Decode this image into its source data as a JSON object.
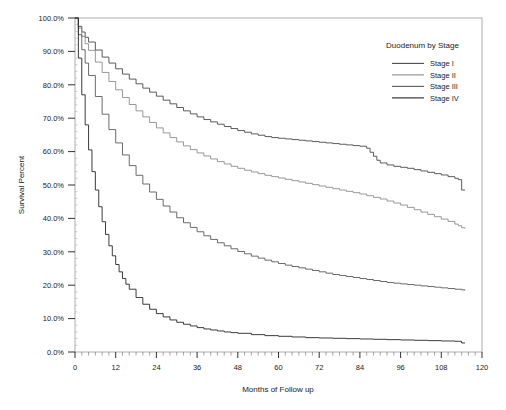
{
  "chart_data": {
    "type": "line",
    "title": "",
    "xlabel": "Months of Follow up",
    "ylabel": "Survival Percent",
    "xlim": [
      0,
      120
    ],
    "ylim": [
      0,
      100
    ],
    "xticks": [
      0,
      12,
      24,
      36,
      48,
      60,
      72,
      84,
      96,
      108,
      120
    ],
    "xtick_labels": [
      "0",
      "12",
      "24",
      "36",
      "48",
      "60",
      "72",
      "84",
      "96",
      "108",
      "120"
    ],
    "yticks": [
      0,
      10,
      20,
      30,
      40,
      50,
      60,
      70,
      80,
      90,
      100
    ],
    "ytick_labels": [
      "0.0%",
      "10.0%",
      "20.0%",
      "30.0%",
      "40.0%",
      "50.0%",
      "60.0%",
      "70.0%",
      "80.0%",
      "90.0%",
      "100.0%"
    ],
    "minor_tick_interval": 2,
    "grid": false,
    "legend": {
      "title": "Duodenum by Stage",
      "position": "top-right",
      "entries": [
        {
          "label": "Stage I",
          "color": "#4a4a4a"
        },
        {
          "label": "Stage II",
          "color": "#8c8c8c"
        },
        {
          "label": "Stage III",
          "color": "#5a5a5a"
        },
        {
          "label": "Stage IV",
          "color": "#262626"
        }
      ]
    },
    "series": [
      {
        "name": "Stage I",
        "color": "#4a4a4a",
        "x": [
          0,
          1,
          2,
          3,
          4,
          6,
          8,
          10,
          12,
          14,
          16,
          18,
          20,
          22,
          24,
          26,
          28,
          30,
          32,
          34,
          36,
          38,
          40,
          42,
          44,
          46,
          48,
          50,
          52,
          54,
          56,
          58,
          60,
          62,
          64,
          66,
          68,
          70,
          72,
          74,
          76,
          78,
          80,
          82,
          84,
          86,
          87,
          88,
          89,
          90,
          92,
          94,
          96,
          98,
          100,
          102,
          104,
          106,
          108,
          110,
          112,
          113,
          114,
          115
        ],
        "y": [
          100.0,
          97.5,
          95.8,
          94.2,
          92.8,
          90.4,
          88.3,
          86.5,
          84.8,
          83.2,
          81.7,
          80.3,
          79.0,
          77.8,
          76.6,
          75.4,
          74.3,
          73.2,
          72.2,
          71.3,
          70.4,
          69.6,
          68.9,
          68.2,
          67.5,
          66.9,
          66.3,
          65.8,
          65.3,
          64.9,
          64.5,
          64.2,
          64.0,
          63.8,
          63.6,
          63.4,
          63.2,
          63.0,
          62.8,
          62.6,
          62.4,
          62.2,
          62.0,
          61.8,
          61.6,
          61.0,
          59.8,
          58.6,
          57.4,
          56.6,
          56.0,
          55.6,
          55.3,
          55.0,
          54.6,
          54.2,
          53.8,
          53.4,
          53.0,
          52.5,
          52.0,
          51.6,
          48.5,
          48.5
        ]
      },
      {
        "name": "Stage II",
        "color": "#8c8c8c",
        "x": [
          0,
          1,
          2,
          3,
          4,
          6,
          8,
          10,
          12,
          14,
          16,
          18,
          20,
          22,
          24,
          26,
          28,
          30,
          32,
          34,
          36,
          38,
          40,
          42,
          44,
          46,
          48,
          50,
          52,
          54,
          56,
          58,
          60,
          62,
          64,
          66,
          68,
          70,
          72,
          74,
          76,
          78,
          80,
          82,
          84,
          86,
          88,
          90,
          92,
          94,
          96,
          98,
          100,
          102,
          104,
          106,
          108,
          110,
          112,
          113,
          114,
          115
        ],
        "y": [
          100.0,
          97.0,
          94.5,
          92.3,
          90.3,
          86.8,
          83.7,
          81.0,
          78.5,
          76.2,
          74.1,
          72.2,
          70.4,
          68.7,
          67.1,
          65.6,
          64.2,
          62.9,
          61.7,
          60.6,
          59.6,
          58.7,
          57.8,
          57.0,
          56.3,
          55.6,
          55.0,
          54.4,
          53.9,
          53.4,
          52.9,
          52.5,
          52.1,
          51.7,
          51.3,
          50.9,
          50.5,
          50.1,
          49.7,
          49.3,
          48.9,
          48.5,
          48.1,
          47.7,
          47.3,
          46.8,
          46.3,
          45.8,
          45.2,
          44.6,
          44.0,
          43.3,
          42.6,
          41.9,
          41.2,
          40.5,
          39.8,
          39.1,
          38.3,
          37.8,
          37.2,
          37.0
        ]
      },
      {
        "name": "Stage III",
        "color": "#5a5a5a",
        "x": [
          0,
          1,
          2,
          3,
          4,
          6,
          8,
          10,
          12,
          14,
          16,
          18,
          20,
          22,
          24,
          26,
          28,
          30,
          32,
          34,
          36,
          38,
          40,
          42,
          44,
          46,
          48,
          50,
          52,
          54,
          56,
          58,
          60,
          62,
          64,
          66,
          68,
          70,
          72,
          74,
          76,
          78,
          80,
          82,
          84,
          86,
          88,
          90,
          92,
          94,
          96,
          98,
          100,
          102,
          104,
          106,
          108,
          110,
          112,
          114,
          115
        ],
        "y": [
          100.0,
          95.0,
          90.5,
          86.5,
          82.8,
          76.5,
          71.2,
          66.6,
          62.6,
          59.0,
          55.8,
          52.9,
          50.3,
          47.9,
          45.7,
          43.7,
          41.9,
          40.2,
          38.7,
          37.3,
          36.0,
          34.8,
          33.7,
          32.7,
          31.8,
          30.9,
          30.1,
          29.4,
          28.7,
          28.1,
          27.5,
          27.0,
          26.5,
          26.0,
          25.6,
          25.2,
          24.8,
          24.4,
          24.0,
          23.6,
          23.2,
          22.9,
          22.6,
          22.3,
          22.0,
          21.7,
          21.4,
          21.1,
          20.8,
          20.6,
          20.4,
          20.2,
          20.0,
          19.8,
          19.6,
          19.4,
          19.2,
          19.0,
          18.8,
          18.6,
          18.5
        ]
      },
      {
        "name": "Stage IV",
        "color": "#262626",
        "x": [
          0,
          1,
          2,
          3,
          4,
          5,
          6,
          7,
          8,
          9,
          10,
          11,
          12,
          13,
          14,
          15,
          16,
          18,
          20,
          22,
          24,
          26,
          28,
          30,
          32,
          34,
          36,
          38,
          40,
          42,
          44,
          46,
          48,
          52,
          56,
          60,
          64,
          68,
          72,
          76,
          80,
          84,
          88,
          92,
          96,
          100,
          104,
          108,
          112,
          113,
          114,
          115
        ],
        "y": [
          100.0,
          88.0,
          77.0,
          68.0,
          60.5,
          54.0,
          48.5,
          43.5,
          39.0,
          35.2,
          31.8,
          28.8,
          26.2,
          24.0,
          22.0,
          20.3,
          18.8,
          16.3,
          14.3,
          12.8,
          11.5,
          10.5,
          9.6,
          8.9,
          8.3,
          7.8,
          7.3,
          6.9,
          6.6,
          6.3,
          6.0,
          5.8,
          5.6,
          5.2,
          4.9,
          4.7,
          4.5,
          4.3,
          4.2,
          4.1,
          4.0,
          3.9,
          3.8,
          3.7,
          3.6,
          3.5,
          3.4,
          3.3,
          3.2,
          3.2,
          2.7,
          2.7
        ]
      }
    ]
  }
}
